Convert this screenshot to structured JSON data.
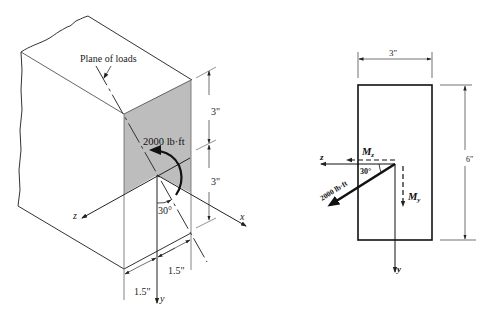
{
  "left_figure": {
    "plane_label": "Plane of loads",
    "moment_label": "2000 lb·ft",
    "angle_label": "30°",
    "dim_upper": "3\"",
    "dim_lower": "3\"",
    "dim_bottom_right": "1.5\"",
    "dim_bottom_left": "1.5\"",
    "axis_z": "z",
    "axis_x": "x",
    "axis_y": "y",
    "shade_color": "#bdbdbd"
  },
  "right_figure": {
    "width_label": "3″",
    "height_label": "6″",
    "mz_label": "M",
    "mz_sub": "z",
    "my_label": "M",
    "my_sub": "y",
    "moment_label": "2000 lb·ft",
    "angle_label": "30°",
    "axis_z": "z",
    "axis_y": "y"
  }
}
